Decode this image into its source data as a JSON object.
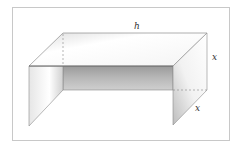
{
  "diagram": {
    "labels": {
      "top_edge": "h",
      "right_height": "x",
      "right_depth": "x"
    },
    "colors": {
      "frame": "#c8c8c8",
      "edge": "#777777",
      "back_panel_dark": "#8e8e8e",
      "back_panel_light": "#c4c4c4",
      "face_light": "#ffffff",
      "face_shade": "#d9d9d9"
    }
  }
}
